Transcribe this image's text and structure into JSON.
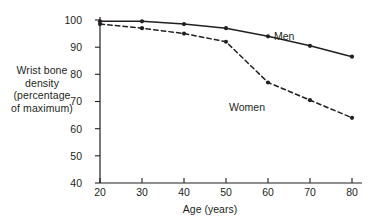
{
  "chart_data": {
    "type": "line",
    "title": "",
    "xlabel": "Age (years)",
    "ylabel": "Wrist bone density (percentage of maximum)",
    "ylabel_lines": [
      "Wrist bone",
      "density",
      "(percentage",
      "of maximum)"
    ],
    "x": [
      20,
      30,
      40,
      50,
      60,
      70,
      80
    ],
    "categories": [
      "20",
      "30",
      "40",
      "50",
      "60",
      "70",
      "80"
    ],
    "xticks": [
      "20",
      "30",
      "40",
      "50",
      "60",
      "70",
      "80"
    ],
    "yticks": [
      "40",
      "50",
      "60",
      "70",
      "80",
      "90",
      "100"
    ],
    "xlim": [
      20,
      80
    ],
    "ylim": [
      40,
      100
    ],
    "grid": false,
    "legend_position": "inline-annotation",
    "series": [
      {
        "name": "Men",
        "label": "Men",
        "linestyle": "solid",
        "color": "#231f20",
        "marker": "circle",
        "values": [
          99.5,
          99.5,
          98.5,
          97,
          94,
          90.5,
          86.5
        ]
      },
      {
        "name": "Women",
        "label": "Women",
        "linestyle": "dashed",
        "color": "#231f20",
        "marker": "circle",
        "values": [
          98.5,
          97,
          95,
          92,
          77,
          70.5,
          64
        ]
      }
    ],
    "annotations": [
      {
        "text": "Men",
        "x": 68,
        "y": 95
      },
      {
        "text": "Women",
        "x": 56,
        "y": 71
      }
    ]
  },
  "axis": {
    "line_color": "#231f20"
  }
}
